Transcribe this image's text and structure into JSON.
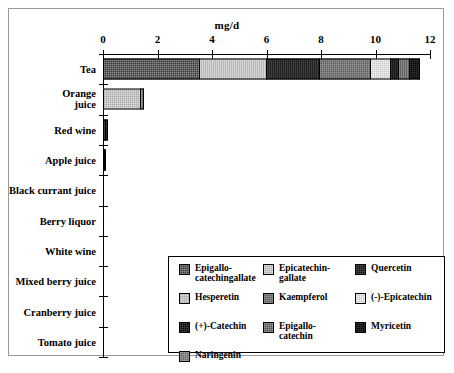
{
  "chart_data": {
    "type": "bar",
    "orientation": "horizontal",
    "stacked": true,
    "title": "mg/d",
    "xlabel": "mg/d",
    "ylabel": "",
    "xlim": [
      0,
      12
    ],
    "xticks": [
      0,
      2,
      4,
      6,
      8,
      10,
      12
    ],
    "xticklabels": [
      "0",
      "2",
      "4",
      "6",
      "8",
      "10",
      "12"
    ],
    "grid": false,
    "legend_position": "inside-lower-right",
    "categories": [
      "Tea",
      "Orange\njuice",
      "Red wine",
      "Apple juice",
      "Black currant juice",
      "Berry liquor",
      "White wine",
      "Mixed berry juice",
      "Cranberry juice",
      "Tomato juice"
    ],
    "series": [
      {
        "name": "Epigallo-\ncatechingallate",
        "key": "egcg",
        "pattern": "p-egcg",
        "color": "#3a3a3a",
        "values": [
          3.55,
          0,
          0,
          0,
          0,
          0,
          0,
          0,
          0,
          0
        ]
      },
      {
        "name": "Epicatechin-\ngallate",
        "key": "ecg",
        "pattern": "p-ecg",
        "color": "#a8a8a8",
        "values": [
          2.5,
          0,
          0,
          0,
          0,
          0,
          0,
          0,
          0,
          0
        ]
      },
      {
        "name": "Quercetin",
        "key": "quercetin",
        "pattern": "p-quercetin",
        "color": "#141414",
        "values": [
          2.0,
          0,
          0.12,
          0.02,
          0,
          0,
          0,
          0,
          0,
          0
        ]
      },
      {
        "name": "Hesperetin",
        "key": "hesperetin",
        "pattern": "p-hesperetin",
        "color": "#e2e2e2",
        "values": [
          0,
          1.38,
          0,
          0,
          0,
          0,
          0,
          0,
          0,
          0
        ]
      },
      {
        "name": "Kaempferol",
        "key": "kaempferol",
        "pattern": "p-kaempferol",
        "color": "#5e5e5e",
        "values": [
          1.9,
          0,
          0,
          0,
          0,
          0,
          0,
          0,
          0,
          0
        ]
      },
      {
        "name": "(-)-Epicatechin",
        "key": "epicatechin",
        "pattern": "p-epicatechin2",
        "color": "#c9c9c9",
        "values": [
          0.75,
          0,
          0,
          0,
          0,
          0,
          0,
          0,
          0,
          0
        ]
      },
      {
        "name": "(+)-Catechin",
        "key": "catechin",
        "pattern": "p-catechin",
        "color": "#0d0d0d",
        "values": [
          0.35,
          0,
          0.1,
          0.02,
          0,
          0,
          0,
          0,
          0,
          0
        ]
      },
      {
        "name": "Epigallo-\ncatechin",
        "key": "egc",
        "pattern": "p-egc",
        "color": "#4a4a4a",
        "values": [
          0.45,
          0,
          0,
          0,
          0,
          0,
          0,
          0,
          0,
          0
        ]
      },
      {
        "name": "Myricetin",
        "key": "myricetin",
        "pattern": "p-myricetin",
        "color": "#0a0a0a",
        "values": [
          0.4,
          0,
          0,
          0,
          0,
          0,
          0,
          0,
          0,
          0
        ]
      },
      {
        "name": "Naringenin",
        "key": "naringenin",
        "pattern": "p-naringenin",
        "color": "#6a6a6a",
        "values": [
          0,
          0.17,
          0,
          0,
          0,
          0,
          0,
          0,
          0,
          0
        ]
      }
    ],
    "totals": [
      11.9,
      1.55,
      0.22,
      0.04,
      0,
      0,
      0,
      0,
      0,
      0
    ],
    "legend_columns": [
      [
        "Epigallo-\ncatechingallate",
        "Hesperetin",
        "(+)-Catechin",
        "Naringenin"
      ],
      [
        "Epicatechin-\ngallate",
        "Kaempferol",
        "Epigallo-\ncatechin"
      ],
      [
        "Quercetin",
        "(-)-Epicatechin",
        "Myricetin"
      ]
    ]
  }
}
